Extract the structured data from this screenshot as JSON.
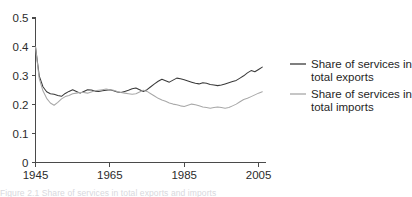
{
  "figure": {
    "background_color": "#ffffff",
    "caption_partial": "Figure 2.1 Share of services in total exports and imports"
  },
  "legend": {
    "position": "right",
    "entries": [
      {
        "label_line1": "Share of services in",
        "label_line2": "total exports",
        "color": "#3a3a3a"
      },
      {
        "label_line1": "Share of services in",
        "label_line2": "total imports",
        "color": "#a8a8a8"
      }
    ]
  },
  "chart_data": {
    "type": "line",
    "title": "",
    "subtitle": "",
    "xlabel": "",
    "ylabel": "",
    "xlim": [
      1945,
      2007
    ],
    "ylim": [
      0,
      0.5
    ],
    "grid": false,
    "legend_position": "right",
    "x_ticks": [
      1945,
      1965,
      1985,
      2005
    ],
    "x_tick_labels": [
      "1945",
      "1965",
      "1985",
      "2005"
    ],
    "y_ticks": [
      0,
      0.1,
      0.2,
      0.3,
      0.4,
      0.5
    ],
    "y_tick_labels": [
      "0",
      "0.1",
      "0.2",
      "0.3",
      "0.4",
      "0.5"
    ],
    "x": [
      1945,
      1946,
      1947,
      1948,
      1949,
      1950,
      1951,
      1952,
      1953,
      1954,
      1955,
      1956,
      1957,
      1958,
      1959,
      1960,
      1961,
      1962,
      1963,
      1964,
      1965,
      1966,
      1967,
      1968,
      1969,
      1970,
      1971,
      1972,
      1973,
      1974,
      1975,
      1976,
      1977,
      1978,
      1979,
      1980,
      1981,
      1982,
      1983,
      1984,
      1985,
      1986,
      1987,
      1988,
      1989,
      1990,
      1991,
      1992,
      1993,
      1994,
      1995,
      1996,
      1997,
      1998,
      1999,
      2000,
      2001,
      2002,
      2003,
      2004,
      2005,
      2006
    ],
    "series": [
      {
        "name": "Share of services in total exports",
        "color": "#3a3a3a",
        "values": [
          0.4,
          0.3,
          0.262,
          0.245,
          0.238,
          0.236,
          0.232,
          0.229,
          0.239,
          0.246,
          0.252,
          0.246,
          0.24,
          0.246,
          0.252,
          0.251,
          0.247,
          0.246,
          0.248,
          0.25,
          0.252,
          0.248,
          0.244,
          0.242,
          0.246,
          0.25,
          0.255,
          0.258,
          0.252,
          0.246,
          0.252,
          0.262,
          0.272,
          0.281,
          0.288,
          0.283,
          0.278,
          0.285,
          0.292,
          0.29,
          0.286,
          0.282,
          0.278,
          0.274,
          0.272,
          0.276,
          0.274,
          0.27,
          0.268,
          0.266,
          0.268,
          0.272,
          0.276,
          0.28,
          0.284,
          0.292,
          0.3,
          0.31,
          0.318,
          0.314,
          0.322,
          0.33
        ]
      },
      {
        "name": "Share of services in total imports",
        "color": "#a8a8a8",
        "values": [
          0.4,
          0.29,
          0.248,
          0.222,
          0.206,
          0.198,
          0.208,
          0.22,
          0.228,
          0.232,
          0.238,
          0.24,
          0.242,
          0.242,
          0.24,
          0.244,
          0.248,
          0.25,
          0.252,
          0.254,
          0.252,
          0.25,
          0.246,
          0.242,
          0.24,
          0.238,
          0.236,
          0.238,
          0.244,
          0.25,
          0.246,
          0.238,
          0.23,
          0.222,
          0.216,
          0.212,
          0.206,
          0.202,
          0.2,
          0.196,
          0.194,
          0.198,
          0.202,
          0.2,
          0.196,
          0.192,
          0.19,
          0.188,
          0.19,
          0.192,
          0.19,
          0.188,
          0.19,
          0.196,
          0.202,
          0.21,
          0.218,
          0.222,
          0.228,
          0.234,
          0.24,
          0.245
        ]
      }
    ]
  }
}
